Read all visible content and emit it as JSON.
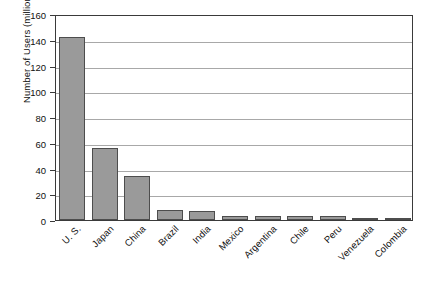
{
  "chart_data": {
    "type": "bar",
    "title": "",
    "xlabel": "",
    "ylabel": "Number of Users (millions)",
    "categories": [
      "U. S.",
      "Japan",
      "China",
      "Brazil",
      "India",
      "Mexico",
      "Argentina",
      "Chile",
      "Peru",
      "Venezuela",
      "Colombia"
    ],
    "values": [
      142,
      56,
      34,
      8,
      7,
      3,
      3,
      3,
      3,
      1.5,
      1.5
    ],
    "ylim": [
      0,
      160
    ],
    "ytick_labels": [
      "0",
      "20",
      "40",
      "60",
      "80",
      "100",
      "120",
      "140",
      "160"
    ],
    "ytick_values": [
      0,
      20,
      40,
      60,
      80,
      100,
      120,
      140,
      160
    ],
    "grid": true,
    "legend": "none",
    "bar_color": "#9a9a9a",
    "bar_edge_color": "#4d4d4d",
    "axis_color": "#3a3a3a",
    "grid_color": "#a8a8a8",
    "background": "#ffffff"
  }
}
